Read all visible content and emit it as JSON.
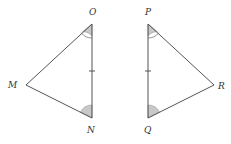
{
  "diagram": {
    "type": "congruent-triangles",
    "triangles": [
      {
        "name": "triangle-MON",
        "vertices": {
          "O": [
            92,
            24
          ],
          "N": [
            92,
            118
          ],
          "M": [
            26,
            85
          ]
        },
        "labels": {
          "O": "O",
          "N": "N",
          "M": "M"
        },
        "tick_side": "ON",
        "double_arc_angle": "O",
        "single_arc_angle": "N"
      },
      {
        "name": "triangle-PQR",
        "vertices": {
          "P": [
            148,
            24
          ],
          "Q": [
            148,
            118
          ],
          "R": [
            214,
            85
          ]
        },
        "labels": {
          "P": "P",
          "Q": "Q",
          "R": "R"
        },
        "tick_side": "PQ",
        "double_arc_angle": "P",
        "single_arc_angle": "Q"
      }
    ],
    "colors": {
      "line": "#555555",
      "angle_fill": "#c8c8c8",
      "background": "#ffffff"
    }
  }
}
